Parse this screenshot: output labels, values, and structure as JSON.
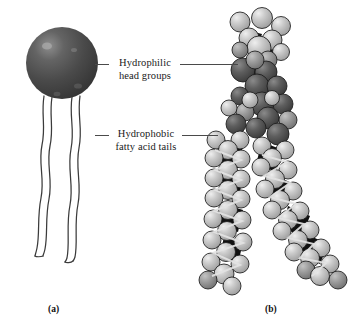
{
  "figure": {
    "background_color": "#ffffff"
  },
  "labels": [
    {
      "id": "hydrophilic",
      "line1": "Hydrophilic",
      "line2": "head groups",
      "leader_left": true,
      "leader_right": true
    },
    {
      "id": "hydrophobic",
      "line1": "Hydrophobic",
      "line2": "fatty acid tails",
      "leader_left": true,
      "leader_right": true
    }
  ],
  "captions": {
    "panel_a": "(a)",
    "panel_b": "(b)"
  },
  "panel_a": {
    "name": "schematic-phospholipid",
    "head": {
      "shape": "sphere",
      "fill_color": "#454545",
      "highlight_color": "#8d8d8d",
      "center_x": 62,
      "center_y": 63,
      "radius": 36
    },
    "tails": [
      {
        "name": "fatty-acid-tail-left",
        "stroke_color": "#3b3b3b"
      },
      {
        "name": "fatty-acid-tail-right",
        "stroke_color": "#3b3b3b"
      }
    ]
  },
  "panel_b": {
    "name": "space-filling-model",
    "atom_colors": {
      "light_gray": "#c9c9c9",
      "mid_gray": "#9a9a9a",
      "dark_gray": "#5c5c5c",
      "darkest": "#2a2a2a",
      "outline": "#1b1b1b"
    },
    "regions": [
      {
        "name": "head-group-region",
        "description": "choline and phosphate spheres at top"
      },
      {
        "name": "glycerol-backbone-region",
        "description": "dark spheres mid-upper"
      },
      {
        "name": "tail-chain-straight",
        "description": "left vertical saturated chain"
      },
      {
        "name": "tail-chain-kinked",
        "description": "right chain bending to lower right"
      }
    ]
  }
}
